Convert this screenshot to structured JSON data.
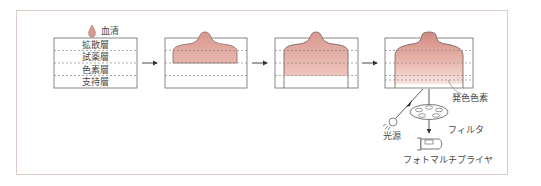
{
  "figure": {
    "serum_label": "血清",
    "layers": [
      {
        "label": "拡散層"
      },
      {
        "label": "試薬層"
      },
      {
        "label": "色素層"
      },
      {
        "label": "支持層"
      }
    ],
    "stages": 4,
    "detector": {
      "chromophore_label": "発色色素",
      "light_source_label": "光源",
      "filter_label": "フィルタ",
      "photomultiplier_label": "フォトマルチプライヤ"
    },
    "colors": {
      "frame_border": "#dccbc7",
      "box_border": "#6a6a6a",
      "dashed_line": "#8a8a8a",
      "serum_dark": "#d9938a",
      "serum_mid": "#e8b2a8",
      "serum_light": "#f6ddd8",
      "text": "#4a4a4a"
    }
  }
}
